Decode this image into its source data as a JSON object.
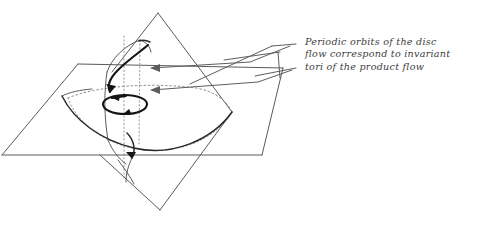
{
  "figure": {
    "title": "Periodic orbits of the disc flow correspond to invariant tori of the product flow",
    "background_color": "#ffffff",
    "ink_color": "#4a4a4a",
    "emphasis_color": "#151515",
    "style": "hand-drawn mathematical sketch"
  },
  "caption": {
    "line1": "Periodic orbits of the disc",
    "line2": "flow correspond to invariant",
    "line3": "tori of the product flow"
  },
  "elements": {
    "horizontal_plane_label": "horizontal-plane",
    "vertical_plane_label": "vertical-diamond-plane",
    "cylinder_label": "invariant-torus-cylinder",
    "periodic_orbit_label": "periodic-orbit-circle",
    "flow_arrow_upper_label": "helical-flow-arrow",
    "flow_arrow_lower_label": "lower-flow-arrow",
    "disc_outline_label": "disc-boundary",
    "leader_upper_label": "leader-line-upper",
    "leader_lower_label": "leader-line-lower"
  }
}
